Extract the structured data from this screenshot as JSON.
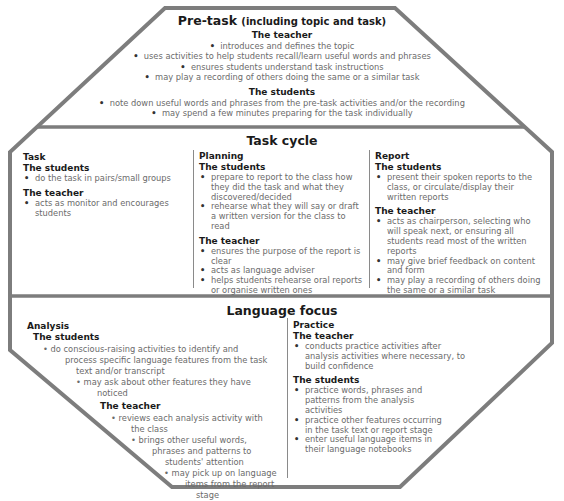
{
  "colors": {
    "outline": "#7d7d7d",
    "heading": "#1a1a1a",
    "body_text": "#6b6b6b"
  },
  "pre_task": {
    "title": "Pre-task",
    "subtitle": "(including topic and task)",
    "teacher_heading": "The teacher",
    "teacher_items": [
      "introduces and defines the topic",
      "uses activities to help students recall/learn useful words and phrases",
      "ensures students understand task instructions",
      "may play a recording of others doing the same or a similar task"
    ],
    "students_heading": "The students",
    "students_items": [
      "note down useful words and phrases from the pre-task activities and/or the recording",
      "may spend a few minutes preparing for the task individually"
    ]
  },
  "task_cycle": {
    "title": "Task cycle",
    "task": {
      "label": "Task",
      "students_heading": "The students",
      "students_items": [
        "do the task in pairs/small groups"
      ],
      "teacher_heading": "The teacher",
      "teacher_items": [
        "acts as monitor and encourages students"
      ]
    },
    "planning": {
      "label": "Planning",
      "students_heading": "The students",
      "students_items": [
        "prepare to report to the class how they did the task and what they discovered/decided",
        "rehearse what they will say or draft a written version for the class to read"
      ],
      "teacher_heading": "The teacher",
      "teacher_items": [
        "ensures the purpose of the report is clear",
        "acts as language adviser",
        "helps students rehearse oral reports or organise written ones"
      ]
    },
    "report": {
      "label": "Report",
      "students_heading": "The students",
      "students_items": [
        "present their spoken reports to the class, or circulate/display their written reports"
      ],
      "teacher_heading": "The teacher",
      "teacher_items": [
        "acts as chairperson, selecting who will speak next, or ensuring all students read most of the written reports",
        "may give brief feedback on content and form",
        "may play a recording of others doing the same or a similar task"
      ]
    }
  },
  "language_focus": {
    "title": "Language focus",
    "analysis": {
      "label": "Analysis",
      "students_heading": "The students",
      "students_lines": [
        "do conscious-raising activities to identify and",
        "process specific language features from the task",
        "text and/or transcript",
        "may ask about other features they have",
        "noticed"
      ],
      "teacher_heading": "The teacher",
      "teacher_lines": [
        "reviews each analysis activity with",
        "the class",
        "brings other useful words,",
        "phrases and patterns to",
        "students' attention",
        "may pick up on language",
        "items from the report",
        "stage"
      ]
    },
    "practice": {
      "label": "Practice",
      "teacher_heading": "The teacher",
      "teacher_items": [
        "conducts practice activities after analysis activities where necessary, to build confidence"
      ],
      "students_heading": "The students",
      "students_items": [
        "practice words, phrases and patterns from the analysis activities",
        "practice other features occurring in the task text or report stage",
        "enter useful language items in their language notebooks"
      ]
    }
  },
  "bullet": "•"
}
